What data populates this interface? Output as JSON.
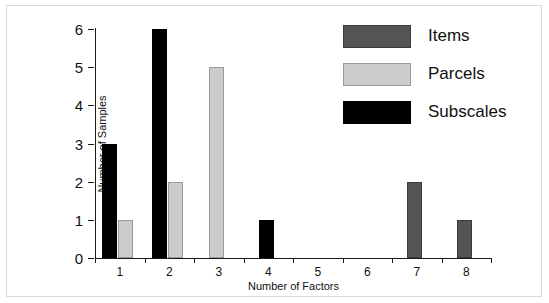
{
  "chart_data": {
    "type": "bar",
    "title": "",
    "xlabel": "Number of Factors",
    "ylabel": "Number of Samples",
    "categories": [
      "1",
      "2",
      "3",
      "4",
      "5",
      "6",
      "7",
      "8"
    ],
    "series": [
      {
        "name": "Items",
        "color": "#555555",
        "values": [
          0,
          0,
          0,
          0,
          0,
          0,
          2,
          1
        ]
      },
      {
        "name": "Parcels",
        "color": "#cccccc",
        "values": [
          1,
          2,
          5,
          0,
          0,
          0,
          0,
          0
        ]
      },
      {
        "name": "Subscales",
        "color": "#000000",
        "values": [
          3,
          6,
          0,
          1,
          0,
          0,
          0,
          0
        ]
      }
    ],
    "ylim": [
      0,
      6
    ],
    "yticks": [
      0,
      1,
      2,
      3,
      4,
      5,
      6
    ],
    "ytick_labels": [
      "0",
      "1",
      "2",
      "3",
      "4",
      "5",
      "6"
    ],
    "grid": false,
    "legend_position": "top-right"
  },
  "legend": {
    "entries": [
      {
        "label": "Items",
        "swatch": "items"
      },
      {
        "label": "Parcels",
        "swatch": "parcels"
      },
      {
        "label": "Subscales",
        "swatch": "subscales"
      }
    ]
  },
  "axes": {
    "x_title": "Number of Factors",
    "y_title": "Number of Samples"
  }
}
